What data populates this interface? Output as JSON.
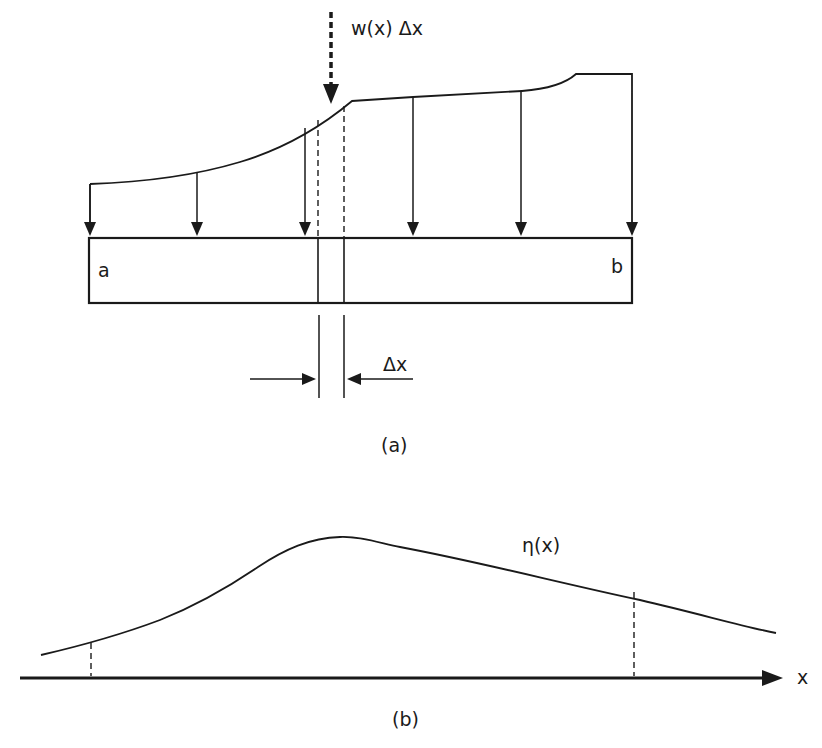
{
  "figure_a": {
    "load_label": "w(x) Δx",
    "end_left_label": "a",
    "end_right_label": "b",
    "element_width_label": "Δx",
    "caption": "(a)"
  },
  "figure_b": {
    "curve_label": "η(x)",
    "axis_label": "x",
    "caption": "(b)"
  },
  "colors": {
    "ink": "#1a1a1a",
    "background": "#ffffff"
  }
}
